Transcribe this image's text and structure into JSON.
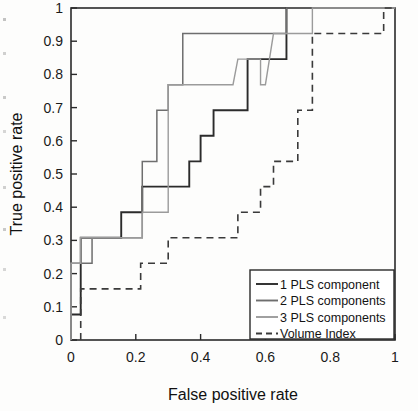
{
  "chart_data": {
    "type": "line",
    "title": "",
    "xlabel": "False positive rate",
    "ylabel": "True positive rate",
    "xlim": [
      0,
      1
    ],
    "ylim": [
      0,
      1
    ],
    "grid": false,
    "legend_position": "lower-right",
    "x_ticks": [
      "0",
      "0.2",
      "0.4",
      "0.6",
      "0.8",
      "1"
    ],
    "x_tick_values": [
      0,
      0.2,
      0.4,
      0.6,
      0.8,
      1
    ],
    "y_ticks": [
      "0",
      "0.1",
      "0.2",
      "0.3",
      "0.4",
      "0.5",
      "0.6",
      "0.7",
      "0.8",
      "0.9",
      "1"
    ],
    "y_tick_values": [
      0,
      0.1,
      0.2,
      0.3,
      0.4,
      0.5,
      0.6,
      0.7,
      0.8,
      0.9,
      1
    ],
    "series": [
      {
        "name": "1 PLS component",
        "color": "#2b2b2b",
        "dash": "none",
        "width": 1.9,
        "points": [
          [
            0.0,
            0.0
          ],
          [
            0.0,
            0.077
          ],
          [
            0.03,
            0.077
          ],
          [
            0.03,
            0.308
          ],
          [
            0.155,
            0.308
          ],
          [
            0.155,
            0.385
          ],
          [
            0.22,
            0.385
          ],
          [
            0.22,
            0.462
          ],
          [
            0.365,
            0.462
          ],
          [
            0.365,
            0.538
          ],
          [
            0.4,
            0.538
          ],
          [
            0.4,
            0.615
          ],
          [
            0.44,
            0.615
          ],
          [
            0.44,
            0.692
          ],
          [
            0.545,
            0.692
          ],
          [
            0.545,
            0.846
          ],
          [
            0.665,
            0.846
          ],
          [
            0.665,
            1.0
          ],
          [
            0.75,
            1.0
          ],
          [
            1.0,
            1.0
          ]
        ]
      },
      {
        "name": "2 PLS components",
        "color": "#6e6e6e",
        "dash": "none",
        "width": 1.5,
        "points": [
          [
            0.0,
            0.0
          ],
          [
            0.0,
            0.231
          ],
          [
            0.065,
            0.231
          ],
          [
            0.065,
            0.308
          ],
          [
            0.22,
            0.308
          ],
          [
            0.22,
            0.538
          ],
          [
            0.265,
            0.538
          ],
          [
            0.265,
            0.692
          ],
          [
            0.3,
            0.692
          ],
          [
            0.3,
            0.769
          ],
          [
            0.345,
            0.769
          ],
          [
            0.345,
            0.923
          ],
          [
            0.665,
            0.923
          ],
          [
            0.665,
            1.0
          ],
          [
            0.72,
            1.0
          ],
          [
            1.0,
            1.0
          ]
        ]
      },
      {
        "name": "3 PLS components",
        "color": "#9b9b9b",
        "dash": "none",
        "width": 1.4,
        "points": [
          [
            0.0,
            0.0
          ],
          [
            0.0,
            0.231
          ],
          [
            0.03,
            0.231
          ],
          [
            0.03,
            0.308
          ],
          [
            0.22,
            0.308
          ],
          [
            0.22,
            0.385
          ],
          [
            0.3,
            0.385
          ],
          [
            0.3,
            0.769
          ],
          [
            0.5,
            0.769
          ],
          [
            0.515,
            0.846
          ],
          [
            0.585,
            0.846
          ],
          [
            0.585,
            0.769
          ],
          [
            0.6,
            0.769
          ],
          [
            0.625,
            0.923
          ],
          [
            0.745,
            0.923
          ],
          [
            0.745,
            1.0
          ],
          [
            0.87,
            1.0
          ],
          [
            1.0,
            1.0
          ]
        ]
      },
      {
        "name": "Volume Index",
        "color": "#3a3a3a",
        "dash": "7,5",
        "width": 1.6,
        "points": [
          [
            0.03,
            0.0
          ],
          [
            0.03,
            0.154
          ],
          [
            0.215,
            0.154
          ],
          [
            0.215,
            0.231
          ],
          [
            0.3,
            0.231
          ],
          [
            0.3,
            0.308
          ],
          [
            0.515,
            0.308
          ],
          [
            0.515,
            0.385
          ],
          [
            0.585,
            0.385
          ],
          [
            0.585,
            0.462
          ],
          [
            0.625,
            0.462
          ],
          [
            0.625,
            0.538
          ],
          [
            0.7,
            0.538
          ],
          [
            0.7,
            0.692
          ],
          [
            0.745,
            0.692
          ],
          [
            0.745,
            0.923
          ],
          [
            0.965,
            0.923
          ],
          [
            0.965,
            1.0
          ],
          [
            1.0,
            1.0
          ]
        ]
      }
    ],
    "legend": [
      {
        "label": "1 PLS component",
        "color": "#2b2b2b",
        "dash": "none"
      },
      {
        "label": "2 PLS components",
        "color": "#6e6e6e",
        "dash": "none"
      },
      {
        "label": "3 PLS components",
        "color": "#9b9b9b",
        "dash": "none"
      },
      {
        "label": "Volume Index",
        "color": "#3a3a3a",
        "dash": "6,4"
      }
    ]
  }
}
